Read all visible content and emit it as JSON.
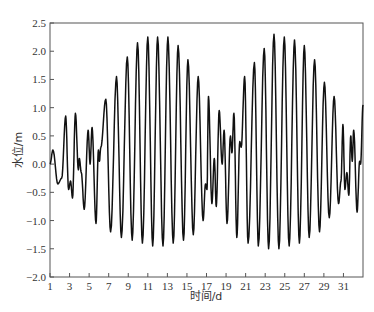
{
  "chart_data": {
    "type": "line",
    "title": "",
    "xlabel": "时间/d",
    "ylabel": "水位/m",
    "xlim": [
      1,
      33
    ],
    "ylim": [
      -2.0,
      2.5
    ],
    "grid": false,
    "legend": null,
    "x_ticks": [
      1,
      3,
      5,
      7,
      9,
      11,
      13,
      15,
      17,
      19,
      21,
      23,
      25,
      27,
      29,
      31
    ],
    "y_ticks": [
      -2.0,
      -1.5,
      -1.0,
      -0.5,
      0.0,
      0.5,
      1.0,
      1.5,
      2.0,
      2.5
    ],
    "y_tick_labels": [
      "-2.0",
      "-1.5",
      "-1.0",
      "-0.5",
      "0.0",
      "0.5",
      "1.0",
      "1.5",
      "2.0",
      "2.5"
    ],
    "line_color": "#111111",
    "series": [
      {
        "name": "水位",
        "extrema": [
          [
            1.0,
            0.0
          ],
          [
            1.3,
            0.25
          ],
          [
            1.8,
            -0.35
          ],
          [
            2.2,
            -0.25
          ],
          [
            2.6,
            0.85
          ],
          [
            2.9,
            -0.45
          ],
          [
            3.1,
            -0.3
          ],
          [
            3.3,
            -0.6
          ],
          [
            3.6,
            0.9
          ],
          [
            3.9,
            -0.1
          ],
          [
            4.0,
            0.1
          ],
          [
            4.2,
            -0.15
          ],
          [
            4.5,
            -0.8
          ],
          [
            4.9,
            0.6
          ],
          [
            5.1,
            0.0
          ],
          [
            5.3,
            0.65
          ],
          [
            5.7,
            -1.05
          ],
          [
            5.95,
            0.25
          ],
          [
            6.05,
            0.05
          ],
          [
            6.2,
            0.3
          ],
          [
            6.7,
            1.15
          ],
          [
            7.2,
            -1.2
          ],
          [
            7.8,
            1.55
          ],
          [
            8.3,
            -1.3
          ],
          [
            8.9,
            1.9
          ],
          [
            9.4,
            -1.35
          ],
          [
            9.95,
            2.15
          ],
          [
            10.45,
            -1.4
          ],
          [
            11.0,
            2.25
          ],
          [
            11.5,
            -1.45
          ],
          [
            12.0,
            2.25
          ],
          [
            12.55,
            -1.45
          ],
          [
            13.05,
            2.25
          ],
          [
            13.6,
            -1.4
          ],
          [
            14.1,
            2.1
          ],
          [
            14.65,
            -1.35
          ],
          [
            15.1,
            1.85
          ],
          [
            15.65,
            -1.25
          ],
          [
            16.15,
            1.55
          ],
          [
            16.65,
            -1.0
          ],
          [
            16.9,
            -0.35
          ],
          [
            17.05,
            -0.45
          ],
          [
            17.2,
            1.2
          ],
          [
            17.55,
            -0.7
          ],
          [
            17.8,
            0.1
          ],
          [
            18.0,
            -0.75
          ],
          [
            18.3,
            0.95
          ],
          [
            18.6,
            0.0
          ],
          [
            18.8,
            0.6
          ],
          [
            19.1,
            -1.05
          ],
          [
            19.45,
            0.5
          ],
          [
            19.6,
            0.2
          ],
          [
            19.8,
            0.9
          ],
          [
            20.1,
            -1.3
          ],
          [
            20.4,
            0.4
          ],
          [
            20.55,
            0.3
          ],
          [
            20.9,
            1.55
          ],
          [
            21.25,
            -1.4
          ],
          [
            21.9,
            1.8
          ],
          [
            22.3,
            -1.45
          ],
          [
            22.9,
            2.05
          ],
          [
            23.35,
            -1.5
          ],
          [
            23.9,
            2.3
          ],
          [
            24.4,
            -1.5
          ],
          [
            24.95,
            2.25
          ],
          [
            25.45,
            -1.45
          ],
          [
            26.0,
            2.2
          ],
          [
            26.5,
            -1.4
          ],
          [
            27.0,
            2.1
          ],
          [
            27.5,
            -1.3
          ],
          [
            28.05,
            1.85
          ],
          [
            28.55,
            -1.2
          ],
          [
            29.05,
            1.45
          ],
          [
            29.55,
            -0.95
          ],
          [
            30.05,
            1.2
          ],
          [
            30.5,
            -0.7
          ],
          [
            30.75,
            -0.3
          ],
          [
            30.95,
            0.7
          ],
          [
            31.15,
            -0.45
          ],
          [
            31.35,
            -0.15
          ],
          [
            31.55,
            -0.55
          ],
          [
            31.75,
            0.5
          ],
          [
            31.9,
            0.05
          ],
          [
            32.05,
            0.6
          ],
          [
            32.4,
            -0.85
          ],
          [
            32.65,
            0.05
          ],
          [
            32.75,
            0.0
          ],
          [
            33.0,
            1.05
          ]
        ]
      }
    ]
  }
}
